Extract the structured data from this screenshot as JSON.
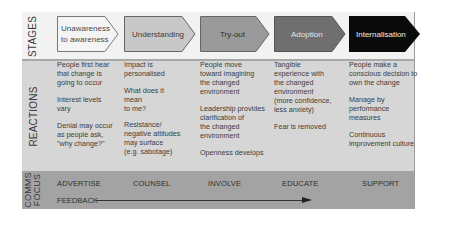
{
  "row_labels": {
    "stages": "STAGES",
    "reactions": "REACTIONS",
    "comms_line1": "COMMS",
    "comms_line2": "FOCUS"
  },
  "stages": [
    {
      "label": "Unawareness\nto awareness",
      "fill": "#f4f4f4",
      "text_color": "#4a4a4a"
    },
    {
      "label": "Understanding",
      "fill": "#c8c8c8",
      "text_color": "#3a3a3a"
    },
    {
      "label": "Try-out",
      "fill": "#9a9a9a",
      "text_color": "#2e2e2e"
    },
    {
      "label": "Adoption",
      "fill": "#6f6f6f",
      "text_color": "#e6e6e6"
    },
    {
      "label": "Internalisation",
      "fill": "#0a0a0a",
      "text_color": "#f0f0f0"
    }
  ],
  "reactions": [
    [
      "People first hear\nthat change is\ngoing to occur",
      "Interest levels\nvary",
      "Denial may occur\nas people ask,\n\"why change?\""
    ],
    [
      "Impact is\npersonalised",
      "What does it\nmean\nto me?",
      "Resistance/\nnegative attitudes\nmay surface\n(e.g. sabotage)"
    ],
    [
      "People move\ntoward imagining\nthe changed\nenvironment",
      "Leadership provides\nclarification of\nthe changed\nenvironment",
      "Openness develops"
    ],
    [
      "Tangible\nexperience with\nthe changed\nenvironment\n(more confidence,\nless anxiety)",
      "Fear is removed"
    ],
    [
      "People make a\nconscious decision to\nown the change",
      "Manage by\nperformance\nmeasures",
      "Continuous\nimprovement culture"
    ]
  ],
  "comms_focus": [
    "ADVERTISE",
    "COUNSEL",
    "INVOLVE",
    "EDUCATE",
    "SUPPORT"
  ],
  "feedback_label": "FEEDBACK"
}
